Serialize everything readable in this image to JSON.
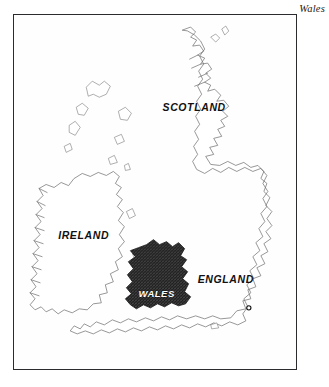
{
  "figure": {
    "caption": "Wales",
    "title_position": "top-right"
  },
  "map": {
    "name": "british-isles-map",
    "frame": {
      "border_color": "#2b2b2f",
      "background": "#fefefe"
    },
    "labels": [
      {
        "id": "scotland",
        "text": "SCOTLAND",
        "x": 148,
        "y": 96
      },
      {
        "id": "ireland",
        "text": "IRELAND",
        "x": 44,
        "y": 223
      },
      {
        "id": "england",
        "text": "ENGLAND",
        "x": 183,
        "y": 267
      },
      {
        "id": "wales",
        "text": "WALES",
        "x": 124,
        "y": 281
      }
    ],
    "highlight": {
      "region": "Wales",
      "fill_style": "dark-stipple",
      "fill_color": "#1c1c1c"
    },
    "marker": {
      "id": "city-dot",
      "x": 234,
      "y": 292
    },
    "colors": {
      "coastline": "#6b6b6b",
      "highlight": "#1c1c1c",
      "label_text": "#111111",
      "highlight_label_text": "#ffffff",
      "frame": "#2b2b2f",
      "sea": "#ffffff"
    }
  }
}
